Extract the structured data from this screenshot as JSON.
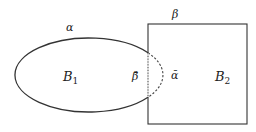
{
  "diagram": {
    "stroke_color": "#333333",
    "background": "#ffffff",
    "ellipse": {
      "name": "region B1",
      "boundary_label": "α",
      "interior_label": "B",
      "interior_subscript": "1",
      "cx": 89,
      "cy": 75,
      "rx": 74,
      "ry": 37
    },
    "square": {
      "name": "region B2",
      "boundary_label": "β",
      "interior_label": "B",
      "interior_subscript": "2",
      "x": 148,
      "y": 24,
      "width": 99,
      "height": 100
    },
    "overlap": {
      "alpha_bar_label": "ᾱ",
      "beta_bar_label": "β̄",
      "note": "dashed arc = ellipse boundary inside square; dotted line = square edge inside ellipse"
    }
  }
}
